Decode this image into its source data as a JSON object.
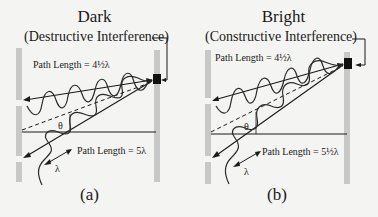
{
  "panels": [
    {
      "id": "a",
      "title": "Dark",
      "subtitle": "(Destructive Interference)",
      "top_path_label": "Path Length = 4½λ",
      "bottom_path_label": "Path Length = 5λ",
      "angle_label": "θ",
      "wavelength_label": "λ",
      "caption": "(a)"
    },
    {
      "id": "b",
      "title": "Bright",
      "subtitle": "(Constructive Interference)",
      "top_path_label": "Path Length = 4½λ",
      "bottom_path_label": "Path Length = 5½λ",
      "angle_label": "θ",
      "wavelength_label": "λ",
      "caption": "(b)"
    }
  ],
  "colors": {
    "background": "#f4f4f2",
    "wall": "#c8c8c8",
    "line": "#1a1a1a",
    "wave": "#2a2a2a"
  }
}
